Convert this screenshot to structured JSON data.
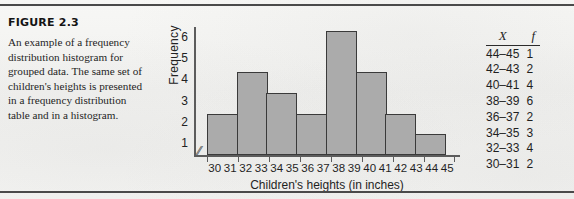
{
  "figure": {
    "label": "FIGURE 2.3",
    "caption": "An example of a frequency distribution histogram for grouped data. The same set of children's heights is presented in a frequency distribution table and in a histogram."
  },
  "chart_data": {
    "type": "bar",
    "title": "",
    "xlabel": "Children's heights (in inches)",
    "ylabel": "Frequency",
    "categories": [
      "30-31",
      "32-33",
      "34-35",
      "36-37",
      "38-39",
      "40-41",
      "42-43",
      "44-45"
    ],
    "tick_pairs": [
      [
        "30",
        "31"
      ],
      [
        "32",
        "33"
      ],
      [
        "34",
        "35"
      ],
      [
        "36",
        "37"
      ],
      [
        "38",
        "39"
      ],
      [
        "40",
        "41"
      ],
      [
        "42",
        "43"
      ],
      [
        "44",
        "45"
      ]
    ],
    "values": [
      2,
      4,
      3,
      2,
      6,
      4,
      2,
      1
    ],
    "yticks": [
      "6",
      "5",
      "4",
      "3",
      "2",
      "1"
    ],
    "ylim": [
      0,
      6
    ],
    "grid": false,
    "axis_break": "⁄⁄",
    "bar_color": "#ababab",
    "bar_border_color": "#3a3a3a",
    "axis_color": "#5c5c5c"
  },
  "table": {
    "headers": [
      "X",
      "f"
    ],
    "rows": [
      {
        "x": "44–45",
        "f": "1"
      },
      {
        "x": "42–43",
        "f": "2"
      },
      {
        "x": "40–41",
        "f": "4"
      },
      {
        "x": "38–39",
        "f": "6"
      },
      {
        "x": "36–37",
        "f": "2"
      },
      {
        "x": "34–35",
        "f": "3"
      },
      {
        "x": "32–33",
        "f": "4"
      },
      {
        "x": "30–31",
        "f": "2"
      }
    ]
  }
}
